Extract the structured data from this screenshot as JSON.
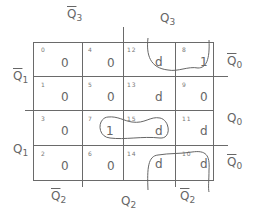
{
  "kmap": {
    "col_labels_top": [
      {
        "var": "Q",
        "sub": "3",
        "bar": true
      },
      {
        "var": "Q",
        "sub": "3",
        "bar": false
      }
    ],
    "col_labels_bottom": [
      {
        "var": "Q",
        "sub": "2",
        "bar": true
      },
      {
        "var": "Q",
        "sub": "2",
        "bar": false
      },
      {
        "var": "Q",
        "sub": "2",
        "bar": true
      }
    ],
    "row_labels_left": [
      {
        "var": "Q",
        "sub": "1",
        "bar": true
      },
      {
        "var": "Q",
        "sub": "1",
        "bar": false
      }
    ],
    "row_labels_right": [
      {
        "var": "Q",
        "sub": "0",
        "bar": true
      },
      {
        "var": "Q",
        "sub": "0",
        "bar": false
      },
      {
        "var": "Q",
        "sub": "0",
        "bar": true
      }
    ],
    "cells": [
      [
        {
          "idx": "0",
          "val": "0"
        },
        {
          "idx": "4",
          "val": "0"
        },
        {
          "idx": "12",
          "val": "d"
        },
        {
          "idx": "8",
          "val": "1"
        }
      ],
      [
        {
          "idx": "1",
          "val": "0"
        },
        {
          "idx": "5",
          "val": "0"
        },
        {
          "idx": "13",
          "val": "d"
        },
        {
          "idx": "9",
          "val": "0"
        }
      ],
      [
        {
          "idx": "3",
          "val": "0"
        },
        {
          "idx": "7",
          "val": "1"
        },
        {
          "idx": "15",
          "val": "d"
        },
        {
          "idx": "11",
          "val": "d"
        }
      ],
      [
        {
          "idx": "2",
          "val": "0"
        },
        {
          "idx": "6",
          "val": "0"
        },
        {
          "idx": "14",
          "val": "d"
        },
        {
          "idx": "10",
          "val": "d"
        }
      ]
    ],
    "groupings": [
      "cells 12,8 (top row, right half)",
      "cells 7,15 (row 3)",
      "cells 14,10 (bottom row, right half)"
    ]
  }
}
